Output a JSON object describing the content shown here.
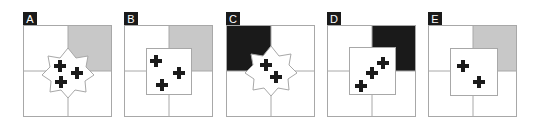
{
  "colors": {
    "line": "#a8a8a8",
    "gray_fill": "#c8c8c8",
    "black_fill": "#1a1a1a",
    "cross": "#1a1a1a",
    "bg": "#ffffff"
  },
  "panels": [
    {
      "label": "A",
      "x": 23,
      "shaded_quadrant": "top-right",
      "shade": "gray",
      "overlay": "star",
      "crosses": 3
    },
    {
      "label": "B",
      "x": 124,
      "shaded_quadrant": "top-right",
      "shade": "gray",
      "overlay": "square",
      "crosses": 3
    },
    {
      "label": "C",
      "x": 226,
      "shaded_quadrant": "top-left",
      "shade": "black",
      "overlay": "star",
      "crosses": 2
    },
    {
      "label": "D",
      "x": 327,
      "shaded_quadrant": "top-right",
      "shade": "black",
      "overlay": "square",
      "crosses": 3
    },
    {
      "label": "E",
      "x": 428,
      "shaded_quadrant": "top-right",
      "shade": "gray",
      "overlay": "square",
      "crosses": 2
    }
  ]
}
